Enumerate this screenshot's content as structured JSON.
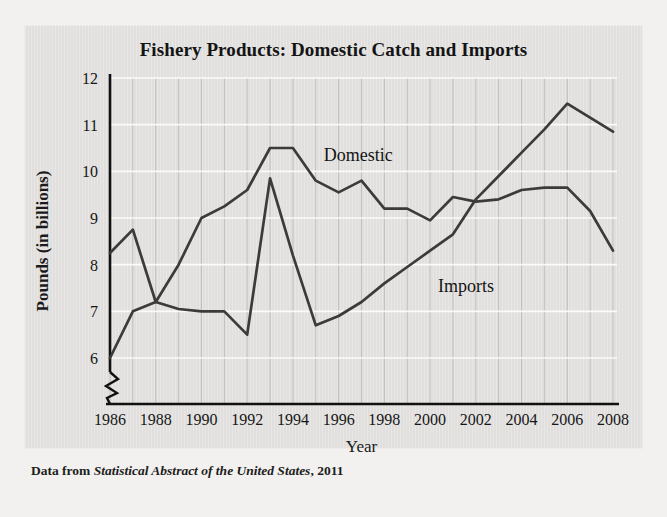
{
  "figure": {
    "title": "Fishery Products: Domestic Catch and Imports",
    "caption_lead": "Data from ",
    "caption_source": "Statistical Abstract of the United States",
    "caption_tail": ", 2011"
  },
  "colors": {
    "page_background": "#f2f1ef",
    "panel_background": "#e3e2e0",
    "line": "#3b3b3b",
    "axis": "#111111",
    "gridline": "#9a9a9a",
    "gridline_major": "#ffffff",
    "text": "#141414"
  },
  "chart_data": {
    "type": "line",
    "title": "Fishery Products: Domestic Catch and Imports",
    "xlabel": "Year",
    "ylabel": "Pounds (in billions)",
    "xlim": [
      1986,
      2008
    ],
    "ylim": [
      5.6,
      12
    ],
    "yticks": [
      6,
      7,
      8,
      9,
      10,
      11,
      12
    ],
    "xticks": [
      1986,
      1988,
      1990,
      1992,
      1994,
      1996,
      1998,
      2000,
      2002,
      2004,
      2006,
      2008
    ],
    "x": [
      1986,
      1987,
      1988,
      1989,
      1990,
      1991,
      1992,
      1993,
      1994,
      1995,
      1996,
      1997,
      1998,
      1999,
      2000,
      2001,
      2002,
      2003,
      2004,
      2005,
      2006,
      2007,
      2008
    ],
    "grid": "vertical-yearly-and-horizontal-major",
    "y_axis_break": true,
    "legend_position": "inline-labels",
    "series": [
      {
        "name": "Domestic",
        "label_year": 1995,
        "values": [
          8.25,
          8.75,
          7.2,
          8.0,
          9.0,
          9.25,
          9.6,
          10.5,
          10.5,
          9.8,
          9.55,
          9.8,
          9.2,
          9.2,
          8.95,
          9.45,
          9.35,
          9.4,
          9.6,
          9.65,
          9.65,
          9.15,
          8.3
        ]
      },
      {
        "name": "Imports",
        "label_year": 2000,
        "values": [
          6.0,
          7.0,
          7.2,
          7.05,
          7.0,
          7.0,
          6.5,
          9.85,
          8.2,
          6.7,
          6.9,
          7.2,
          7.6,
          7.95,
          8.3,
          8.65,
          9.4,
          9.9,
          10.4,
          10.9,
          11.45,
          11.15,
          10.85
        ]
      }
    ],
    "annotations": [
      {
        "text": "Domestic",
        "x": 1995,
        "y": 10.35
      },
      {
        "text": "Imports",
        "x": 2000,
        "y": 7.55
      }
    ]
  }
}
